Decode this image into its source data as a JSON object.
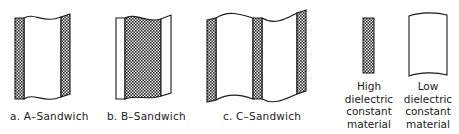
{
  "figure": {
    "panels": [
      {
        "id": "a",
        "caption": "a. A–Sandwich",
        "description": "Two thin high-dielectric skins with low-dielectric core"
      },
      {
        "id": "b",
        "caption": "b. B–Sandwich",
        "description": "Thick high-dielectric core with thin low-dielectric skins"
      },
      {
        "id": "c",
        "caption": "c. C–Sandwich",
        "description": "Three high-dielectric skins with two low-dielectric cores"
      }
    ],
    "legend": {
      "high": {
        "lines": [
          "High",
          "dielectric",
          "constant",
          "material"
        ],
        "swatch": "crosshatch"
      },
      "low": {
        "lines": [
          "Low",
          "dielectric",
          "constant",
          "material"
        ],
        "swatch": "blank"
      }
    },
    "colors": {
      "line": "#1a1a1a",
      "hatch_dark": "#222222",
      "background": "#ffffff"
    }
  }
}
